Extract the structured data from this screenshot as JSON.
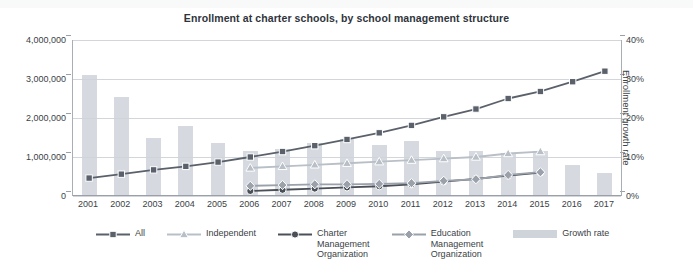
{
  "chart_data": {
    "type": "bar",
    "title": "Enrollment at charter schools, by school management structure",
    "xlabel": "",
    "ylabel": "Enrollment",
    "y2label": "Enrollment growth rate",
    "categories": [
      "2001",
      "2002",
      "2003",
      "2004",
      "2005",
      "2006",
      "2007",
      "2008",
      "2009",
      "2010",
      "2011",
      "2012",
      "2013",
      "2014",
      "2015",
      "2016",
      "2017"
    ],
    "ylim": [
      0,
      4000000
    ],
    "yticks": [
      "0",
      "1,000,000",
      "2,000,000",
      "3,000,000",
      "4,000,000"
    ],
    "ytick_values": [
      0,
      1000000,
      2000000,
      3000000,
      4000000
    ],
    "y2lim": [
      0,
      40
    ],
    "y2ticks": [
      "0%",
      "10%",
      "20%",
      "30%",
      "40%"
    ],
    "y2tick_values": [
      0,
      10,
      20,
      30,
      40
    ],
    "grid": true,
    "legend_position": "bottom",
    "bars": {
      "name": "Growth rate",
      "axis": "right",
      "unit": "%",
      "color": "#cfd4da",
      "values": [
        31.0,
        25.5,
        15.0,
        18.0,
        13.5,
        11.5,
        12.0,
        13.5,
        14.5,
        13.0,
        14.0,
        11.5,
        11.5,
        11.0,
        11.5,
        8.0,
        6.0
      ]
    },
    "series": [
      {
        "name": "All",
        "marker": "square",
        "color": "#5b616b",
        "axis": "left",
        "values": [
          460000,
          560000,
          670000,
          760000,
          870000,
          1000000,
          1140000,
          1290000,
          1450000,
          1620000,
          1810000,
          2030000,
          2230000,
          2500000,
          2680000,
          2930000,
          3200000
        ]
      },
      {
        "name": "Independent",
        "marker": "triangle",
        "color": "#b9bfc7",
        "axis": "left",
        "values": [
          null,
          null,
          null,
          null,
          null,
          720000,
          760000,
          800000,
          840000,
          880000,
          920000,
          960000,
          1000000,
          1090000,
          1140000,
          null,
          null
        ]
      },
      {
        "name": "Charter\nManagement\nOrganization",
        "marker": "circle",
        "color": "#4b5058",
        "axis": "left",
        "values": [
          null,
          null,
          null,
          null,
          null,
          130000,
          160000,
          190000,
          220000,
          250000,
          300000,
          370000,
          440000,
          520000,
          600000,
          null,
          null
        ]
      },
      {
        "name": "Education\nManagement\nOrganization",
        "marker": "diamond",
        "color": "#9aa1aa",
        "axis": "left",
        "values": [
          null,
          null,
          null,
          null,
          null,
          260000,
          280000,
          300000,
          300000,
          310000,
          330000,
          390000,
          430000,
          540000,
          610000,
          null,
          null
        ]
      }
    ],
    "legend": [
      {
        "label": "All",
        "key": "line-square"
      },
      {
        "label": "Independent",
        "key": "line-triangle"
      },
      {
        "label": "Charter\nManagement\nOrganization",
        "key": "line-circle"
      },
      {
        "label": "Education\nManagement\nOrganization",
        "key": "line-diamond"
      },
      {
        "label": "Growth rate",
        "key": "bar-swatch"
      }
    ]
  },
  "colors": {
    "all": "#5b616b",
    "independent": "#b9bfc7",
    "cmo": "#4b5058",
    "emo": "#9aa1aa",
    "bars": "#cfd4da",
    "grid": "#d2d6db",
    "axis": "#9aa0a7",
    "text": "#3b3f46"
  }
}
